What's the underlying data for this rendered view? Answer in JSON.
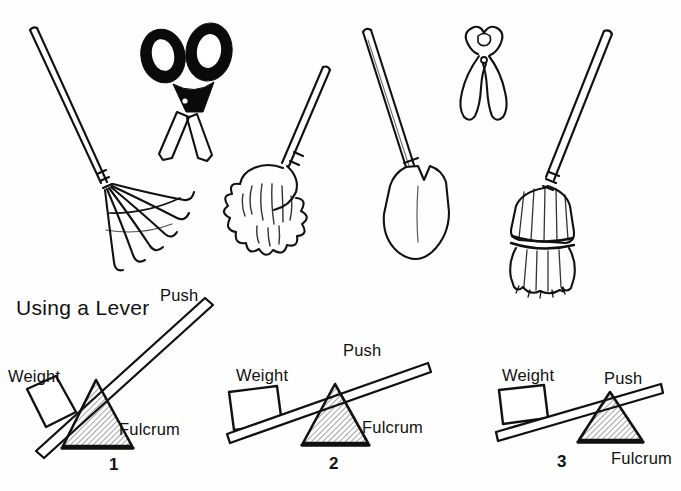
{
  "page": {
    "background_color": "#fefefe",
    "ink_color": "#111111",
    "title": "Using a Lever"
  },
  "tools": [
    {
      "name": "leaf-rake",
      "label": "Leaf rake"
    },
    {
      "name": "scissors",
      "label": "Scissors"
    },
    {
      "name": "mop",
      "label": "Mop"
    },
    {
      "name": "shovel",
      "label": "Shovel"
    },
    {
      "name": "pliers",
      "label": "Pliers"
    },
    {
      "name": "broom",
      "label": "Broom"
    }
  ],
  "levers": [
    {
      "number": "1",
      "weight_label": "Weight",
      "push_label": "Push",
      "fulcrum_label": "Fulcrum",
      "angle_deg": 40,
      "description": "Steep lever, fulcrum close to weight"
    },
    {
      "number": "2",
      "weight_label": "Weight",
      "push_label": "Push",
      "fulcrum_label": "Fulcrum",
      "angle_deg": 17,
      "description": "Moderate lever, fulcrum near middle"
    },
    {
      "number": "3",
      "weight_label": "Weight",
      "push_label": "Push",
      "fulcrum_label": "Fulcrum",
      "angle_deg": 11,
      "description": "Shallow lever, fulcrum toward push end"
    }
  ]
}
